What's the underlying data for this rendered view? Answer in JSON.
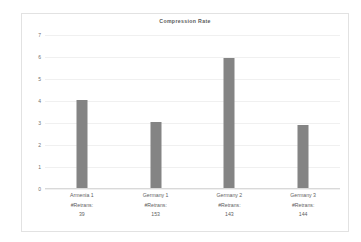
{
  "chart_data": {
    "type": "bar",
    "title": "Compression Rate",
    "xlabel": "",
    "ylabel": "",
    "ylim": [
      0,
      7
    ],
    "yticks": [
      0,
      1,
      2,
      3,
      4,
      5,
      6,
      7
    ],
    "grid": true,
    "legend": null,
    "bar_color": "#848484",
    "categories": [
      "Armenia 1",
      "Germany 1",
      "Germany 2",
      "Germany 3"
    ],
    "category_sublabel": "#Retrans:",
    "retransmissions": [
      39,
      153,
      143,
      144
    ],
    "values": [
      4.05,
      3.05,
      5.97,
      2.93
    ]
  }
}
